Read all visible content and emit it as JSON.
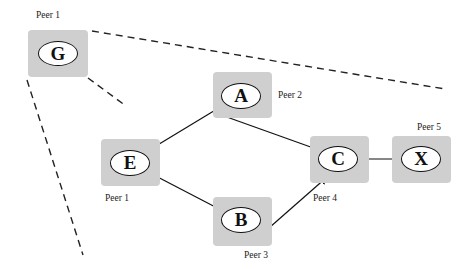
{
  "diagram": {
    "type": "peer-to-peer network graph",
    "nodes": [
      {
        "id": "G",
        "label": "G",
        "peer": "Peer 1"
      },
      {
        "id": "A",
        "label": "A",
        "peer": "Peer 2"
      },
      {
        "id": "E",
        "label": "E",
        "peer": "Peer 1"
      },
      {
        "id": "B",
        "label": "B",
        "peer": "Peer 3"
      },
      {
        "id": "C",
        "label": "C",
        "peer": "Peer 4"
      },
      {
        "id": "X",
        "label": "X",
        "peer": "Peer 5"
      }
    ],
    "edges": [
      {
        "from": "E",
        "to": "A",
        "style": "solid-arrow"
      },
      {
        "from": "E",
        "to": "B",
        "style": "solid-arrow"
      },
      {
        "from": "A",
        "to": "C",
        "style": "solid-arrow"
      },
      {
        "from": "B",
        "to": "C",
        "style": "solid-arrow"
      },
      {
        "from": "C",
        "to": "X",
        "style": "solid-arrow"
      }
    ],
    "zoom_lines": {
      "description": "dashed lines indicating G is a zoomed-out view of the network",
      "style": "dashed"
    },
    "colors": {
      "peer_box": "#cfcfcf",
      "node_fill": "#ffffff",
      "stroke": "#111111"
    }
  }
}
